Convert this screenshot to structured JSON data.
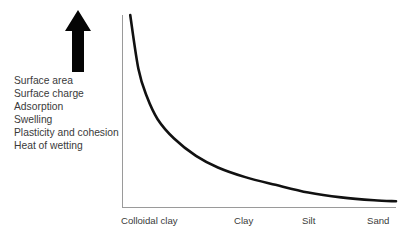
{
  "figure": {
    "background_color": "#ffffff",
    "curve_color": "#111111",
    "axis_color": "#9a9a9a",
    "text_color": "#3a3a3a",
    "arrow": {
      "icon": "up-arrow-icon",
      "direction": "up",
      "meaning": "increasing"
    },
    "property_list": [
      "Surface area",
      "Surface charge",
      "Adsorption",
      "Swelling",
      "Plasticity and cohesion",
      "Heat of wetting"
    ]
  },
  "chart_data": {
    "type": "line",
    "title": "",
    "subtitle": "",
    "xlabel": "",
    "ylabel": "",
    "grid": false,
    "legend": "none",
    "annotations": [
      "Surface area",
      "Surface charge",
      "Adsorption",
      "Swelling",
      "Plasticity and cohesion",
      "Heat of wetting"
    ],
    "categories": [
      "Colloidal clay",
      "Clay",
      "Silt",
      "Sand"
    ],
    "category_positions": [
      0.0,
      0.42,
      0.68,
      0.97
    ],
    "xlim": [
      0,
      1
    ],
    "ylim": [
      0,
      1
    ],
    "series": [
      {
        "name": "Soil particle property magnitude",
        "x": [
          0.03,
          0.06,
          0.09,
          0.13,
          0.19,
          0.27,
          0.35,
          0.45,
          0.56,
          0.68,
          0.8,
          0.92,
          1.0
        ],
        "values": [
          1.0,
          0.72,
          0.58,
          0.46,
          0.36,
          0.27,
          0.21,
          0.16,
          0.12,
          0.08,
          0.055,
          0.04,
          0.035
        ]
      }
    ]
  },
  "geometry": {
    "plot_left": 122,
    "plot_right": 396,
    "plot_top": 15,
    "plot_bottom": 208
  }
}
